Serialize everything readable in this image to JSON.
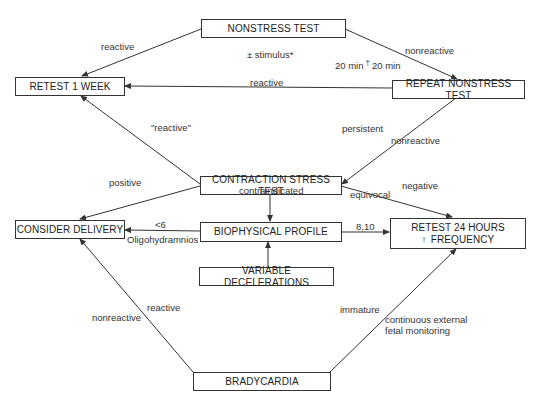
{
  "nodes": {
    "nonstress_test": "NONSTRESS TEST",
    "retest_1_week": "RETEST 1 WEEK",
    "repeat_nonstress_test": "REPEAT NONSTRESS TEST",
    "contraction_stress_test": "CONTRACTION STRESS TEST",
    "consider_delivery": "CONSIDER DELIVERY",
    "biophysical_profile": "BIOPHYSICAL PROFILE",
    "retest_24_hours": "RETEST 24 HOURS",
    "retest_24_hours_line2": "FREQUENCY",
    "retest_24_hours_arrow": "↑",
    "variable_decelerations": "VARIABLE DECELERATIONS",
    "bradycardia": "BRADYCARDIA"
  },
  "edge_labels": {
    "nst_reactive": "reactive",
    "nst_stimulus": "± stimulus*",
    "nst_nonreactive": "nonreactive",
    "nst_20min_a": "20 min",
    "nst_dagger": "†",
    "nst_20min_b": "20 min",
    "repeat_reactive": "reactive",
    "cst_reactive_quoted": "\"reactive\"",
    "repeat_persistent": "persistent",
    "repeat_nonreactive": "nonreactive",
    "cst_positive": "positive",
    "cst_contraindicated": "contraindicated",
    "cst_equivocal": "equivocal",
    "cst_negative": "negative",
    "bpp_lt6": "<6",
    "bpp_oligohydramnios": "Oligohydramnios",
    "bpp_8_10": "8,10",
    "brady_reactive": "reactive",
    "brady_nonreactive": "nonreactive",
    "brady_immature": "immature",
    "brady_continuous_1": "continuous external",
    "brady_continuous_2": "fetal monitoring"
  }
}
